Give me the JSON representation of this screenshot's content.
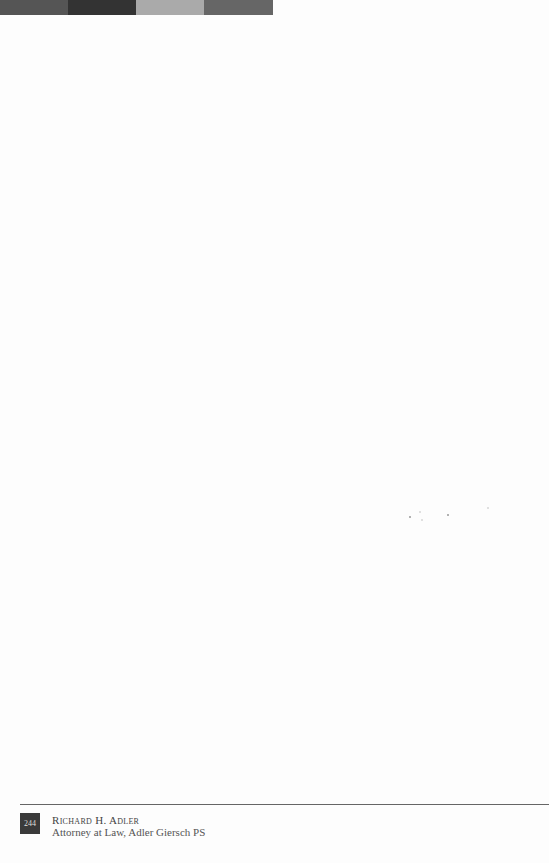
{
  "header_bar": {
    "blocks": [
      {
        "color": "#555555",
        "width": 68
      },
      {
        "color": "#333333",
        "width": 68
      },
      {
        "color": "#aaaaaa",
        "width": 68
      },
      {
        "color": "#666666",
        "width": 69
      }
    ]
  },
  "footer": {
    "page_number": "244",
    "author": "Richard H. Adler",
    "affiliation": "Attorney at Law, Adler Giersch PS"
  }
}
